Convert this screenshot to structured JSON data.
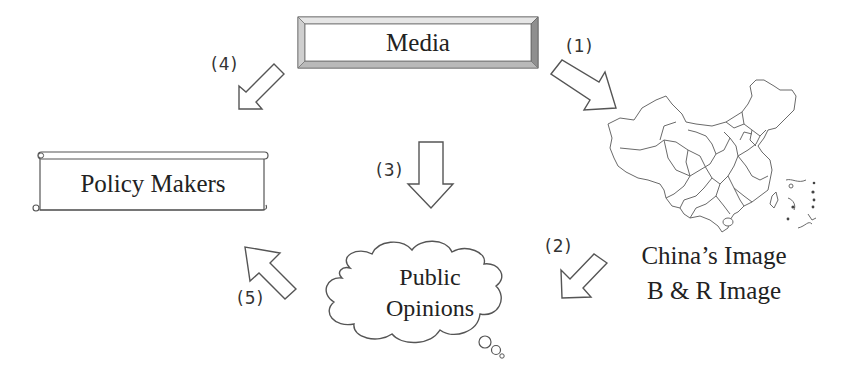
{
  "diagram": {
    "nodes": {
      "media": {
        "label": "Media",
        "shape": "bevel-rectangle"
      },
      "policy_makers": {
        "label": "Policy Makers",
        "shape": "scroll"
      },
      "public_opinions": {
        "label_line1": "Public",
        "label_line2": "Opinions",
        "shape": "thought-cloud"
      },
      "china_image": {
        "label_line1": "China’s Image",
        "label_line2": "B & R Image",
        "shape": "china-map"
      }
    },
    "edges": [
      {
        "id": "1",
        "label": "(1)",
        "from": "media",
        "to": "china_image",
        "direction": "down-right"
      },
      {
        "id": "2",
        "label": "(2)",
        "from": "china_image",
        "to": "public_opinions",
        "direction": "down-left"
      },
      {
        "id": "3",
        "label": "(3)",
        "from": "media",
        "to": "public_opinions",
        "direction": "down"
      },
      {
        "id": "4",
        "label": "(4)",
        "from": "media",
        "to": "policy_makers",
        "direction": "down-left"
      },
      {
        "id": "5",
        "label": "(5)",
        "from": "public_opinions",
        "to": "policy_makers",
        "direction": "up-left"
      }
    ],
    "colors": {
      "stroke": "#555555",
      "bevel_dark": "#8a8a8a",
      "bevel_light": "#d4d4d4",
      "background": "#ffffff"
    }
  }
}
